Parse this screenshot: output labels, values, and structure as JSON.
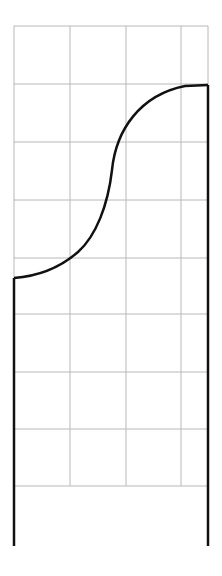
{
  "diagram": {
    "type": "ogee-profile-on-grid",
    "background": "#ffffff",
    "grid": {
      "color": "#b8b8b8",
      "x_lines": [
        14,
        70,
        126,
        181,
        208
      ],
      "y_lines": [
        26,
        84,
        142,
        200,
        258,
        314,
        372,
        429,
        486
      ],
      "left": 14,
      "right": 208,
      "top": 26,
      "bottom": 486
    },
    "profile": {
      "color": "#111111",
      "left_edge": {
        "x": 14,
        "y_top": 278,
        "y_bottom": 546
      },
      "right_edge": {
        "x": 208,
        "y_top": 85,
        "y_bottom": 546
      },
      "curve_path": "M14,278 C40,276 62,266 78,252 C96,236 108,205 112,170 C116,130 140,95 185,86 L208,85"
    }
  }
}
